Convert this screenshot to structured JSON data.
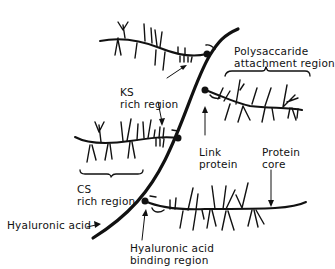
{
  "diagram": {
    "type": "proteoglycan aggregate schematic",
    "colors": {
      "ink": "#111111",
      "background": "#ffffff"
    },
    "labels": {
      "ks_region": {
        "line1": "KS",
        "line2": "rich region"
      },
      "polysaccharide": {
        "line1": "Polysaccaride",
        "line2": "attachment region"
      },
      "link_protein": {
        "line1": "Link",
        "line2": "protein"
      },
      "protein_core": {
        "line1": "Protein",
        "line2": "core"
      },
      "cs_region": {
        "line1": "CS",
        "line2": "rich region"
      },
      "hyaluronic_acid": "Hyaluronic acid",
      "ha_binding": {
        "line1": "Hyaluronic acid",
        "line2": "binding region"
      }
    }
  }
}
